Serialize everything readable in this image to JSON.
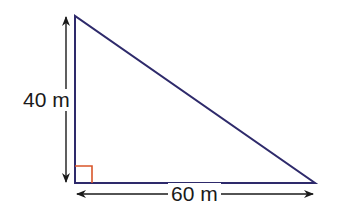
{
  "diagram": {
    "type": "right-triangle",
    "labels": {
      "height": "40 m",
      "base": "60 m"
    },
    "colors": {
      "triangle": "#2e2a6b",
      "right_angle_marker": "#d9562a",
      "arrows": "#1a1a1a"
    }
  }
}
